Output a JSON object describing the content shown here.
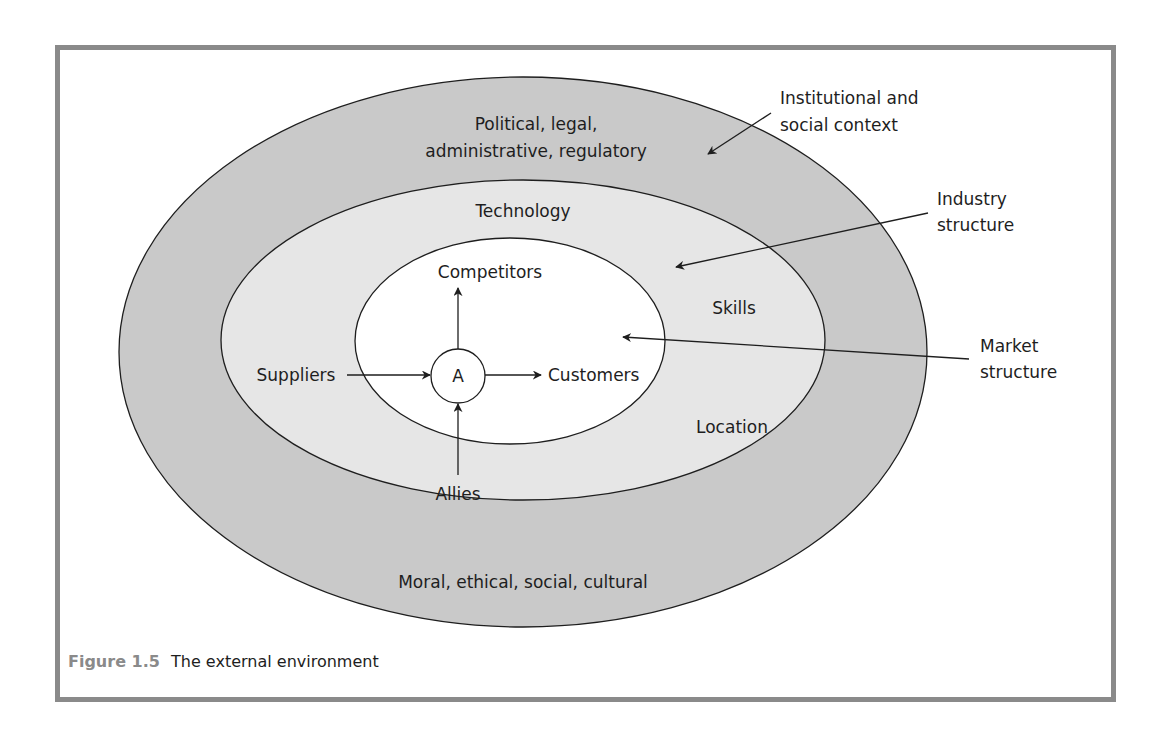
{
  "figure": {
    "number": "Figure 1.5",
    "title": "The external environment",
    "colors": {
      "frame_border": "#8a8a8a",
      "outer_ring": "#c9c9c9",
      "middle_ring": "#e6e6e6",
      "inner_core": "#ffffff",
      "stroke": "#1e1e1e",
      "caption_number": "#8a8a8a"
    }
  },
  "rings": {
    "outer": {
      "label_line1": "Political, legal,",
      "label_line2": "administrative, regulatory",
      "label_bottom": "Moral, ethical, social, cultural"
    },
    "middle": {
      "label_top": "Technology",
      "label_right_upper": "Skills",
      "label_right_lower": "Location"
    },
    "inner": {
      "center": "A",
      "top": "Competitors",
      "right": "Customers",
      "left": "Suppliers",
      "bottom": "Allies"
    }
  },
  "callouts": {
    "institutional": {
      "line1": "Institutional and",
      "line2": "social context"
    },
    "industry": {
      "line1": "Industry",
      "line2": "structure"
    },
    "market": {
      "line1": "Market",
      "line2": "structure"
    }
  }
}
